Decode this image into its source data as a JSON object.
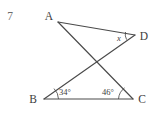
{
  "problem": {
    "number": "7"
  },
  "figure": {
    "type": "geometry-diagram",
    "vertices": [
      {
        "name": "A",
        "label": "A",
        "x": 58,
        "y": 22,
        "label_x": 49,
        "label_y": 20
      },
      {
        "name": "D",
        "label": "D",
        "x": 135,
        "y": 35,
        "label_x": 141,
        "label_y": 40
      },
      {
        "name": "B",
        "label": "B",
        "x": 44,
        "y": 99,
        "label_x": 30,
        "label_y": 102
      },
      {
        "name": "C",
        "label": "C",
        "x": 133,
        "y": 99,
        "label_x": 138,
        "label_y": 103
      }
    ],
    "segments": [
      {
        "name": "segment-AD",
        "from": "A",
        "to": "D"
      },
      {
        "name": "segment-AC",
        "from": "A",
        "to": "C"
      },
      {
        "name": "segment-DB",
        "from": "D",
        "to": "B"
      },
      {
        "name": "segment-BC",
        "from": "B",
        "to": "C"
      }
    ],
    "intersection": {
      "name": "crossing-point",
      "x": 95,
      "y": 57
    },
    "angles": [
      {
        "name": "angle-at-D",
        "vertex": "D",
        "label": "x",
        "italic": true,
        "label_x": 119,
        "label_y": 41,
        "arc_path": "M 125.5 32.6 A 10 10 0 0 0 126.4 39.2"
      },
      {
        "name": "angle-at-B",
        "vertex": "B",
        "label": "34°",
        "italic": false,
        "label_x": 59,
        "label_y": 95,
        "arc_path": "M 58 99 A 14 14 0 0 0 53.5 89.4"
      },
      {
        "name": "angle-at-C",
        "vertex": "C",
        "label": "46°",
        "italic": false,
        "label_x": 101,
        "label_y": 95,
        "arc_path": "M 119 99 A 14 14 0 0 1 124.8 88.4"
      }
    ],
    "colors": {
      "stroke": "#4a4a4a",
      "text": "#3d3d3d",
      "number": "#6b6b6b",
      "background": "#ffffff"
    }
  }
}
